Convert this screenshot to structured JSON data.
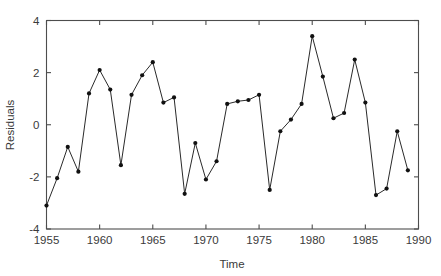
{
  "chart_data": {
    "type": "line",
    "title": "",
    "xlabel": "Time",
    "ylabel": "Residuals",
    "xlim": [
      1955,
      1990
    ],
    "ylim": [
      -4,
      4
    ],
    "xticks": [
      1955,
      1960,
      1965,
      1970,
      1975,
      1980,
      1985,
      1990
    ],
    "xticklabels": [
      "1955",
      "1960",
      "1965",
      "1970",
      "1975",
      "1980",
      "1985",
      "1990"
    ],
    "yticks": [
      -4,
      -2,
      0,
      2,
      4
    ],
    "yticklabels": [
      "-4",
      "-2",
      "0",
      "2",
      "4"
    ],
    "grid": false,
    "legend": null,
    "marker": "filled-circle",
    "line_color": "#2a2a2a",
    "marker_color": "#111111",
    "axis_color": "#4d4d4d",
    "background": "#ffffff",
    "x": [
      1955,
      1956,
      1957,
      1958,
      1959,
      1960,
      1961,
      1962,
      1963,
      1964,
      1965,
      1966,
      1967,
      1968,
      1969,
      1970,
      1971,
      1972,
      1973,
      1974,
      1975,
      1976,
      1977,
      1978,
      1979,
      1980,
      1981,
      1982,
      1983,
      1984,
      1985,
      1986,
      1987,
      1988,
      1989
    ],
    "values": [
      -3.1,
      -2.05,
      -0.85,
      -1.8,
      1.2,
      2.1,
      1.35,
      -1.55,
      1.15,
      1.9,
      2.4,
      0.85,
      1.05,
      -2.65,
      -0.7,
      -2.1,
      -1.4,
      0.8,
      0.9,
      0.95,
      1.15,
      -2.5,
      -0.25,
      0.2,
      0.8,
      3.4,
      1.85,
      0.25,
      0.45,
      2.5,
      0.85,
      -2.7,
      -2.45,
      -0.25,
      -1.75
    ]
  },
  "axis": {
    "y_label": "Residuals",
    "x_label": "Time"
  }
}
